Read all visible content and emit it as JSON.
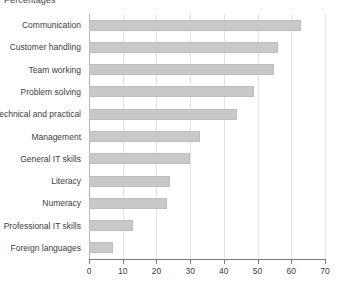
{
  "chart_data": {
    "type": "bar",
    "orientation": "horizontal",
    "title": "Percentages",
    "xlabel": "",
    "ylabel": "",
    "xlim": [
      0,
      70
    ],
    "xticks": [
      0,
      10,
      20,
      30,
      40,
      50,
      60,
      70
    ],
    "grid": true,
    "legend": null,
    "bar_color": "#c9c9c9",
    "bar_border_color": "#bdbdbd",
    "gridline_color": "#e2e2e2",
    "axis_color": "#7d7d7d",
    "text_color": "#3d3d3d",
    "categories": [
      "Communication",
      "Customer handling",
      "Team working",
      "Problem solving",
      "Technical and practical",
      "Management",
      "General IT skills",
      "Literacy",
      "Numeracy",
      "Professional IT skills",
      "Foreign languages"
    ],
    "values": [
      63,
      56,
      55,
      49,
      44,
      33,
      30,
      24,
      23,
      13,
      7
    ],
    "series": [
      {
        "name": "Percentages",
        "values": [
          63,
          56,
          55,
          49,
          44,
          33,
          30,
          24,
          23,
          13,
          7
        ]
      }
    ]
  }
}
